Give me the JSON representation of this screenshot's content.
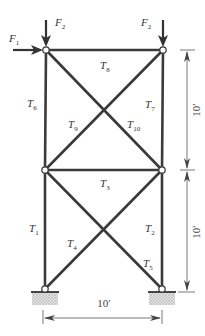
{
  "diagram": {
    "type": "truss",
    "colors": {
      "member": "#3a3a3a",
      "dimension": "#555555",
      "ground": "#cfcfcf",
      "node_fill": "#ffffff"
    },
    "nodes": [
      {
        "id": "top-left",
        "x": 46,
        "y": 50
      },
      {
        "id": "top-right",
        "x": 163,
        "y": 50
      },
      {
        "id": "mid-left",
        "x": 45,
        "y": 170
      },
      {
        "id": "mid-right",
        "x": 162,
        "y": 170
      },
      {
        "id": "bottom-left",
        "x": 45,
        "y": 289
      },
      {
        "id": "bottom-right",
        "x": 162,
        "y": 289
      }
    ],
    "members": [
      {
        "label": "T",
        "sub": "1",
        "from": "mid-left",
        "to": "bottom-left"
      },
      {
        "label": "T",
        "sub": "2",
        "from": "mid-right",
        "to": "bottom-right"
      },
      {
        "label": "T",
        "sub": "3",
        "from": "mid-left",
        "to": "mid-right"
      },
      {
        "label": "T",
        "sub": "4",
        "from": "bottom-left",
        "to": "mid-right"
      },
      {
        "label": "T",
        "sub": "5",
        "from": "mid-left",
        "to": "bottom-right"
      },
      {
        "label": "T",
        "sub": "6",
        "from": "top-left",
        "to": "mid-left"
      },
      {
        "label": "T",
        "sub": "7",
        "from": "top-right",
        "to": "mid-right"
      },
      {
        "label": "T",
        "sub": "8",
        "from": "top-left",
        "to": "top-right"
      },
      {
        "label": "T",
        "sub": "9",
        "from": "mid-left",
        "to": "top-right"
      },
      {
        "label": "T",
        "sub": "10",
        "from": "top-left",
        "to": "mid-right"
      }
    ],
    "forces": [
      {
        "label": "F",
        "sub": "1",
        "direction": "right",
        "at": "top-left"
      },
      {
        "label": "F",
        "sub": "2",
        "direction": "down",
        "at": "top-left"
      },
      {
        "label": "F",
        "sub": "2",
        "direction": "down",
        "at": "top-right"
      }
    ],
    "dimensions": {
      "width": "10′",
      "upper_height": "10′",
      "lower_height": "10′"
    },
    "supports": [
      "bottom-left",
      "bottom-right"
    ]
  }
}
